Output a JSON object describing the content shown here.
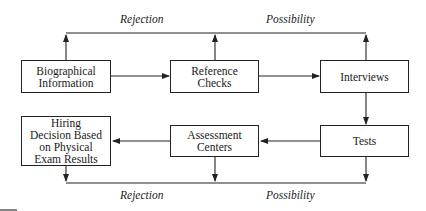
{
  "diagram": {
    "nodes": [
      {
        "id": "biographical",
        "label": "Biographical Information"
      },
      {
        "id": "reference",
        "label": "Reference Checks"
      },
      {
        "id": "interviews",
        "label": "Interviews"
      },
      {
        "id": "tests",
        "label": "Tests"
      },
      {
        "id": "assessment",
        "label": "Assessment Centers"
      },
      {
        "id": "hiring",
        "label": "Hiring Decision Based on Physical Exam Results"
      }
    ],
    "flow_labels": {
      "top_rejection": "Rejection",
      "top_possibility": "Possibility",
      "bottom_rejection": "Rejection",
      "bottom_possibility": "Possibility"
    },
    "edges": [
      {
        "from": "biographical",
        "to": "reference"
      },
      {
        "from": "reference",
        "to": "interviews"
      },
      {
        "from": "interviews",
        "to": "tests"
      },
      {
        "from": "tests",
        "to": "assessment"
      },
      {
        "from": "assessment",
        "to": "hiring"
      }
    ],
    "colors": {
      "line": "#222222",
      "background": "#ffffff"
    }
  }
}
